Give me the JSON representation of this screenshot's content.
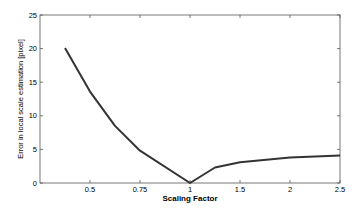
{
  "chart_data": {
    "type": "line",
    "title": "",
    "xlabel": "Scaling Factor",
    "ylabel": "Error in local scale estimation [pixel]",
    "x_scale": "categorical-evenly-spaced",
    "xtick_labels": [
      "0.5",
      "0.75",
      "1",
      "1.5",
      "2",
      "2.5"
    ],
    "xtick_positions": [
      1,
      2,
      3,
      4,
      5,
      6
    ],
    "xlim": [
      0,
      6
    ],
    "ylim": [
      0,
      25
    ],
    "yticks": [
      0,
      5,
      10,
      15,
      20,
      25
    ],
    "grid": false,
    "legend": null,
    "series": [
      {
        "name": "error",
        "color": "#333333",
        "x": [
          0.5,
          1,
          1.5,
          2,
          3,
          3.5,
          4,
          5,
          6
        ],
        "x_values": [
          0.375,
          0.5,
          0.625,
          0.75,
          1.0,
          1.25,
          1.5,
          2.0,
          2.5
        ],
        "values": [
          20.1,
          13.6,
          8.5,
          4.8,
          0.0,
          2.3,
          3.1,
          3.8,
          4.1
        ]
      }
    ]
  }
}
